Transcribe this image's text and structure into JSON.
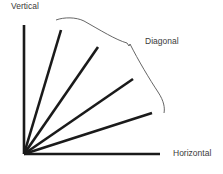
{
  "diagram": {
    "labels": {
      "vertical": "Vertical",
      "diagonal": "Diagonal",
      "horizontal": "Horizontal"
    },
    "colors": {
      "line": "#1a1a1a",
      "brace": "#555555",
      "text": "#3a3a3a",
      "background": "#ffffff"
    },
    "origin": [
      24,
      154
    ],
    "axes": {
      "vertical_end": [
        24,
        25
      ],
      "horizontal_end": [
        160,
        154
      ]
    },
    "diagonal_lines": [
      {
        "end": [
          61,
          30
        ]
      },
      {
        "end": [
          98,
          47
        ]
      },
      {
        "end": [
          133,
          79
        ]
      },
      {
        "end": [
          152,
          113
        ]
      }
    ],
    "brace": {
      "from": [
        56,
        20
      ],
      "cusp": [
        129,
        45
      ],
      "to": [
        164,
        113
      ]
    }
  }
}
